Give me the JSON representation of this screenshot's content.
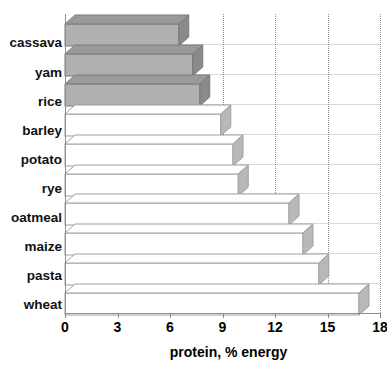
{
  "chart_data": {
    "type": "bar",
    "orientation": "horizontal",
    "title": "",
    "xlabel": "protein, % energy",
    "ylabel": "",
    "categories": [
      "cassava",
      "yam",
      "rice",
      "barley",
      "potato",
      "rye",
      "oatmeal",
      "maize",
      "pasta",
      "wheat"
    ],
    "values": [
      6.5,
      7.3,
      7.7,
      8.9,
      9.6,
      9.9,
      12.8,
      13.6,
      14.5,
      16.8
    ],
    "series": [
      {
        "name": "protein, % energy",
        "values": [
          6.5,
          7.3,
          7.7,
          8.9,
          9.6,
          9.9,
          12.8,
          13.6,
          14.5,
          16.8
        ]
      }
    ],
    "highlighted_categories": [
      "cassava",
      "yam",
      "rice"
    ],
    "xlim": [
      0,
      18
    ],
    "xticks": [
      0,
      3,
      6,
      9,
      12,
      15,
      18
    ],
    "xtick_labels": [
      "0",
      "3",
      "6",
      "9",
      "12",
      "15",
      "18"
    ],
    "gridlines_x": [
      9,
      12,
      15,
      18
    ],
    "grid": "dotted-vertical",
    "legend": "none",
    "style": "3d-shaded-bars"
  },
  "axis": {
    "caption": "protein, % energy"
  },
  "colors": {
    "bar_fill_shaded": "#b0b0b0",
    "bar_fill_open": "#ffffff",
    "bar_side": "#8a8a8a",
    "bar_top": "#9a9a9a",
    "bar_outline": "#7a7a7a",
    "gridline": "#8c8c8c",
    "axis": "#8f8f8f",
    "text": "#000000",
    "background": "#ffffff"
  }
}
